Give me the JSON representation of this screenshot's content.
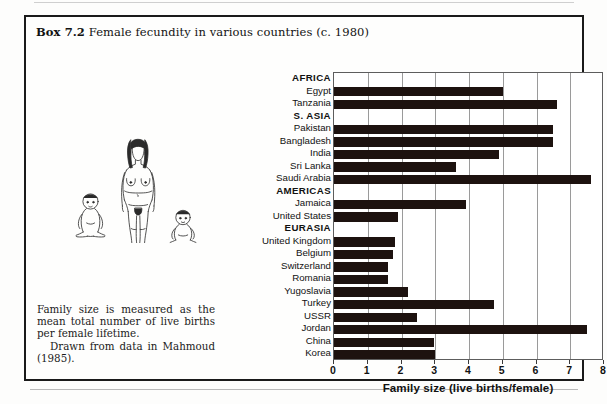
{
  "box": {
    "label": "Box 7.2",
    "title": "Female fecundity in various countries (c. 1980)"
  },
  "caption": {
    "paragraph1": "Family size is measured as the mean total number of live births per female lifetime.",
    "paragraph2": "Drawn from data in Mahmoud (1985)."
  },
  "illustration": {
    "name": "woman-with-two-infants-line-drawing",
    "alt": "Line drawing of an adult female figure flanked by two seated infants"
  },
  "chart_data": {
    "type": "bar",
    "orientation": "horizontal",
    "title": "Female fecundity in various countries (c. 1980)",
    "xlabel": "Family size (live births/female)",
    "ylabel": "",
    "xlim": [
      0,
      8
    ],
    "xticks": [
      0,
      1,
      2,
      3,
      4,
      5,
      6,
      7,
      8
    ],
    "grid": true,
    "grid_axis": "x",
    "legend": "none",
    "bar_color": "#1d120f",
    "rows": [
      {
        "label": "AFRICA",
        "group": true,
        "value": null
      },
      {
        "label": "Egypt",
        "group": false,
        "value": 5.0
      },
      {
        "label": "Tanzania",
        "group": false,
        "value": 6.6
      },
      {
        "label": "S. ASIA",
        "group": true,
        "value": null
      },
      {
        "label": "Pakistan",
        "group": false,
        "value": 6.5
      },
      {
        "label": "Bangladesh",
        "group": false,
        "value": 6.5
      },
      {
        "label": "India",
        "group": false,
        "value": 4.9
      },
      {
        "label": "Sri Lanka",
        "group": false,
        "value": 3.6
      },
      {
        "label": "Saudi Arabia",
        "group": false,
        "value": 7.6
      },
      {
        "label": "AMERICAS",
        "group": true,
        "value": null
      },
      {
        "label": "Jamaica",
        "group": false,
        "value": 3.9
      },
      {
        "label": "United States",
        "group": false,
        "value": 1.9
      },
      {
        "label": "EURASIA",
        "group": true,
        "value": null
      },
      {
        "label": "United Kingdom",
        "group": false,
        "value": 1.8
      },
      {
        "label": "Belgium",
        "group": false,
        "value": 1.75
      },
      {
        "label": "Switzerland",
        "group": false,
        "value": 1.6
      },
      {
        "label": "Romania",
        "group": false,
        "value": 1.6
      },
      {
        "label": "Yugoslavia",
        "group": false,
        "value": 2.2
      },
      {
        "label": "Turkey",
        "group": false,
        "value": 4.75
      },
      {
        "label": "USSR",
        "group": false,
        "value": 2.45
      },
      {
        "label": "Jordan",
        "group": false,
        "value": 7.5
      },
      {
        "label": "China",
        "group": false,
        "value": 2.95
      },
      {
        "label": "Korea",
        "group": false,
        "value": 3.0
      }
    ]
  }
}
